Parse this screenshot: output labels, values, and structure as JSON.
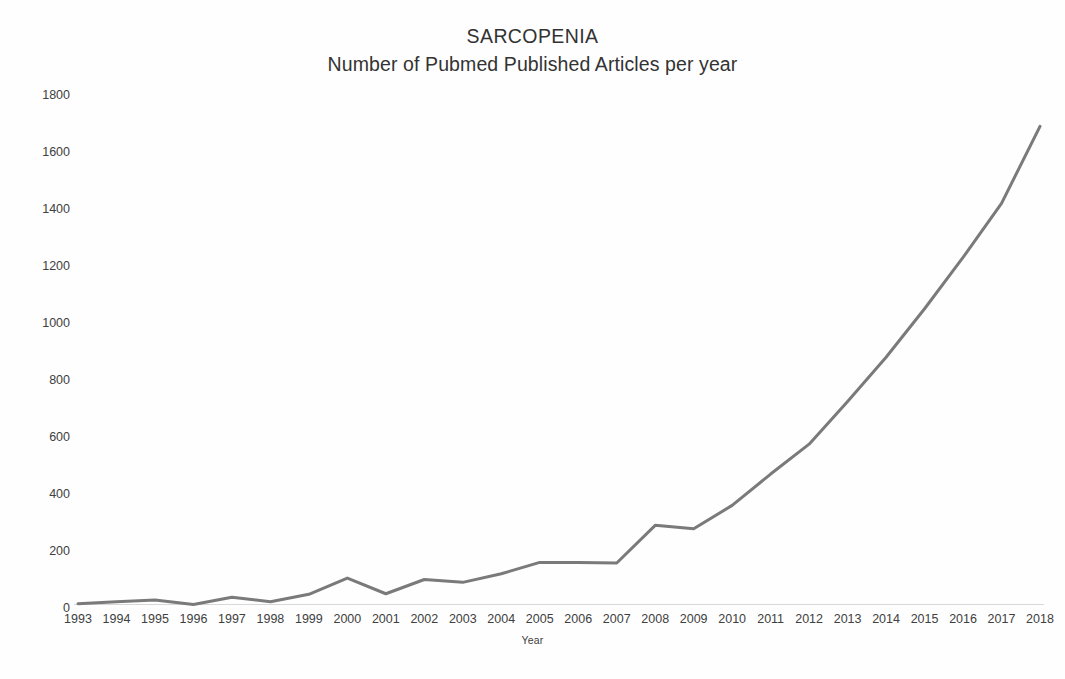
{
  "chart_data": {
    "type": "line",
    "title": "SARCOPENIA",
    "subtitle": "Number of Pubmed Published Articles per year",
    "xlabel": "Year",
    "ylabel": "",
    "categories": [
      "1993",
      "1994",
      "1995",
      "1996",
      "1997",
      "1998",
      "1999",
      "2000",
      "2001",
      "2002",
      "2003",
      "2004",
      "2005",
      "2006",
      "2007",
      "2008",
      "2009",
      "2010",
      "2011",
      "2012",
      "2013",
      "2014",
      "2015",
      "2016",
      "2017",
      "2018"
    ],
    "values": [
      15,
      22,
      28,
      12,
      38,
      22,
      48,
      105,
      50,
      100,
      90,
      120,
      160,
      160,
      158,
      290,
      278,
      360,
      470,
      575,
      725,
      880,
      1050,
      1230,
      1420,
      1690
    ],
    "series": [
      {
        "name": "Number of Pubmed Published Articles per year",
        "values": [
          15,
          22,
          28,
          12,
          38,
          22,
          48,
          105,
          50,
          100,
          90,
          120,
          160,
          160,
          158,
          290,
          278,
          360,
          470,
          575,
          725,
          880,
          1050,
          1230,
          1420,
          1690
        ]
      }
    ],
    "ylim": [
      0,
      1800
    ],
    "yticks": [
      0,
      200,
      400,
      600,
      800,
      1000,
      1200,
      1400,
      1600,
      1800
    ],
    "ytick_labels": [
      "0",
      "200",
      "400",
      "600",
      "800",
      "1000",
      "1200",
      "1400",
      "1600",
      "1800"
    ],
    "grid": false,
    "legend": false,
    "legend_position": "none",
    "line_color": "#7a7a7a",
    "line_width": 3,
    "markers": false,
    "background_color": "#ffffff",
    "axis_color": "#d8d8d8",
    "text_color": "#404040"
  }
}
